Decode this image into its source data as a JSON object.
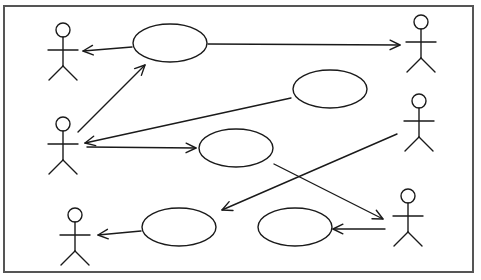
{
  "diagram": {
    "type": "uml-use-case",
    "colors": {
      "line": "#1a1a1a",
      "frame": "#555555",
      "background": "#ffffff"
    },
    "frame": {
      "x": 4,
      "y": 6,
      "width": 469,
      "height": 266
    },
    "actors": [
      {
        "id": "actor-1",
        "x": 63,
        "y": 30
      },
      {
        "id": "actor-2",
        "x": 63,
        "y": 124
      },
      {
        "id": "actor-3",
        "x": 75,
        "y": 215
      },
      {
        "id": "actor-4",
        "x": 421,
        "y": 22
      },
      {
        "id": "actor-5",
        "x": 419,
        "y": 101
      },
      {
        "id": "actor-6",
        "x": 408,
        "y": 196
      }
    ],
    "use_cases": [
      {
        "id": "use-case-1",
        "cx": 170,
        "cy": 43,
        "rx": 37,
        "ry": 19,
        "label": ""
      },
      {
        "id": "use-case-2",
        "cx": 330,
        "cy": 89,
        "rx": 37,
        "ry": 19,
        "label": ""
      },
      {
        "id": "use-case-3",
        "cx": 236,
        "cy": 148,
        "rx": 37,
        "ry": 19,
        "label": ""
      },
      {
        "id": "use-case-4",
        "cx": 179,
        "cy": 227,
        "rx": 37,
        "ry": 19,
        "label": ""
      },
      {
        "id": "use-case-5",
        "cx": 295,
        "cy": 227,
        "rx": 37,
        "ry": 19,
        "label": ""
      }
    ],
    "associations": [
      {
        "id": "uc1-to-actor1",
        "x1": 132,
        "y1": 47,
        "x2": 83,
        "y2": 51
      },
      {
        "id": "uc1-to-actor4",
        "x1": 208,
        "y1": 44,
        "x2": 400,
        "y2": 45
      },
      {
        "id": "actor2-to-uc1",
        "x1": 78,
        "y1": 132,
        "x2": 145,
        "y2": 65
      },
      {
        "id": "uc2-to-actor2",
        "x1": 291,
        "y1": 98,
        "x2": 85,
        "y2": 143
      },
      {
        "id": "actor2-to-uc3",
        "x1": 87,
        "y1": 147,
        "x2": 196,
        "y2": 148
      },
      {
        "id": "uc3-to-actor6",
        "x1": 274,
        "y1": 164,
        "x2": 383,
        "y2": 219
      },
      {
        "id": "actor5-to-uc4",
        "x1": 397,
        "y1": 134,
        "x2": 222,
        "y2": 210
      },
      {
        "id": "uc4-to-actor3",
        "x1": 141,
        "y1": 231,
        "x2": 98,
        "y2": 235
      },
      {
        "id": "actor6-to-uc5",
        "x1": 385,
        "y1": 229,
        "x2": 333,
        "y2": 229
      }
    ]
  }
}
